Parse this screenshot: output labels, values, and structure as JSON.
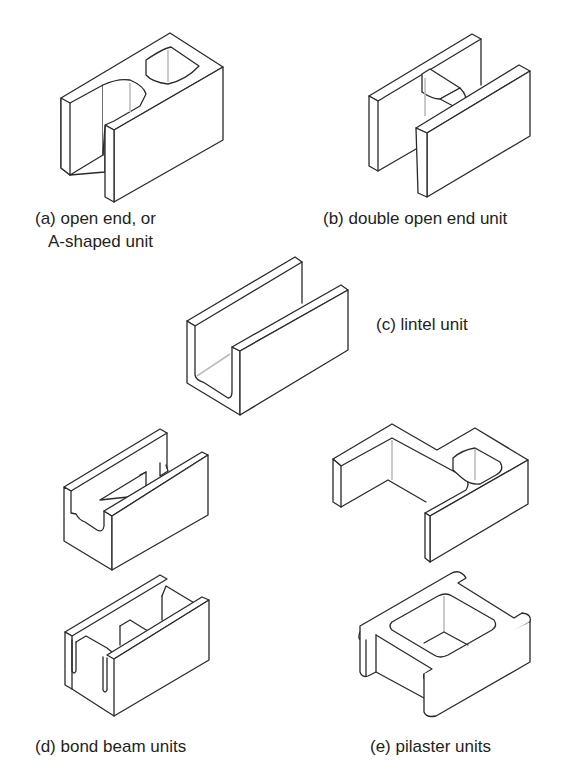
{
  "figure": {
    "type": "concrete masonry unit illustrations",
    "line_color": "#2a2a2a",
    "background": "#ffffff",
    "units": [
      {
        "id": "a",
        "label_line1": "(a) open end, or",
        "label_line2": "A-shaped unit"
      },
      {
        "id": "b",
        "label": "(b) double open end unit"
      },
      {
        "id": "c",
        "label": "(c) lintel unit"
      },
      {
        "id": "d",
        "label": "(d) bond beam units",
        "count": 2
      },
      {
        "id": "e",
        "label": "(e) pilaster units",
        "count": 2
      }
    ]
  }
}
